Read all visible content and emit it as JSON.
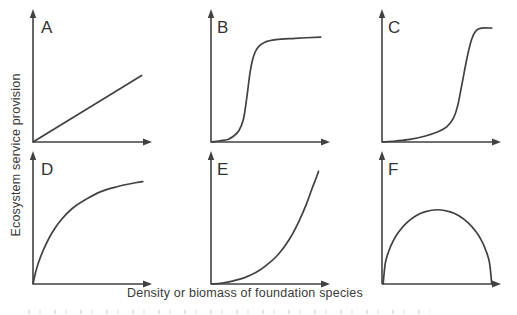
{
  "figure": {
    "y_axis_label": "Ecosystem service provision",
    "x_axis_label": "Density or biomass of foundation species",
    "line_color": "#414141",
    "text_color": "#3a3a3a",
    "axes": {
      "ticks": false,
      "arrowheads": true,
      "tick_labels": "none (conceptual diagram)"
    }
  },
  "chart_data": [
    {
      "type": "line",
      "panel": "A",
      "shape": "linear increase",
      "x_range_norm": [
        0,
        1
      ],
      "y_range_norm": [
        0,
        1
      ],
      "points": [
        [
          0,
          0
        ],
        [
          0.97,
          0.52
        ]
      ]
    },
    {
      "type": "line",
      "panel": "B",
      "shape": "sigmoidal, low threshold, early saturation",
      "points": [
        [
          0,
          0
        ],
        [
          0.08,
          0.01
        ],
        [
          0.15,
          0.02
        ],
        [
          0.2,
          0.045
        ],
        [
          0.25,
          0.09
        ],
        [
          0.29,
          0.18
        ],
        [
          0.32,
          0.35
        ],
        [
          0.35,
          0.55
        ],
        [
          0.38,
          0.67
        ],
        [
          0.42,
          0.74
        ],
        [
          0.48,
          0.78
        ],
        [
          0.58,
          0.8
        ],
        [
          0.75,
          0.81
        ],
        [
          0.98,
          0.82
        ]
      ]
    },
    {
      "type": "line",
      "panel": "C",
      "shape": "sigmoidal, high threshold, late saturation",
      "points": [
        [
          0,
          0
        ],
        [
          0.12,
          0.008
        ],
        [
          0.25,
          0.02
        ],
        [
          0.38,
          0.045
        ],
        [
          0.5,
          0.08
        ],
        [
          0.58,
          0.12
        ],
        [
          0.64,
          0.19
        ],
        [
          0.68,
          0.3
        ],
        [
          0.72,
          0.48
        ],
        [
          0.76,
          0.66
        ],
        [
          0.8,
          0.8
        ],
        [
          0.84,
          0.87
        ],
        [
          0.89,
          0.89
        ],
        [
          0.98,
          0.89
        ]
      ]
    },
    {
      "type": "line",
      "panel": "D",
      "shape": "saturating / asymptotic (decelerating increase)",
      "points": [
        [
          0,
          0
        ],
        [
          0.02,
          0.08
        ],
        [
          0.05,
          0.17
        ],
        [
          0.1,
          0.28
        ],
        [
          0.17,
          0.4
        ],
        [
          0.25,
          0.5
        ],
        [
          0.35,
          0.59
        ],
        [
          0.47,
          0.66
        ],
        [
          0.6,
          0.72
        ],
        [
          0.75,
          0.76
        ],
        [
          0.88,
          0.785
        ],
        [
          0.98,
          0.8
        ]
      ]
    },
    {
      "type": "line",
      "panel": "E",
      "shape": "exponential / accelerating increase",
      "points": [
        [
          0,
          0
        ],
        [
          0.1,
          0.008
        ],
        [
          0.2,
          0.025
        ],
        [
          0.3,
          0.05
        ],
        [
          0.4,
          0.09
        ],
        [
          0.5,
          0.15
        ],
        [
          0.6,
          0.23
        ],
        [
          0.7,
          0.35
        ],
        [
          0.78,
          0.48
        ],
        [
          0.85,
          0.62
        ],
        [
          0.9,
          0.74
        ],
        [
          0.94,
          0.83
        ],
        [
          0.96,
          0.88
        ]
      ]
    },
    {
      "type": "line",
      "panel": "F",
      "shape": "unimodal / hump-shaped (rises then returns to zero)",
      "points": [
        [
          0.01,
          0
        ],
        [
          0.03,
          0.165
        ],
        [
          0.06,
          0.256
        ],
        [
          0.1,
          0.337
        ],
        [
          0.15,
          0.408
        ],
        [
          0.22,
          0.478
        ],
        [
          0.3,
          0.531
        ],
        [
          0.38,
          0.563
        ],
        [
          0.495,
          0.58
        ],
        [
          0.61,
          0.563
        ],
        [
          0.69,
          0.531
        ],
        [
          0.77,
          0.478
        ],
        [
          0.84,
          0.408
        ],
        [
          0.89,
          0.337
        ],
        [
          0.93,
          0.256
        ],
        [
          0.96,
          0.165
        ],
        [
          0.98,
          0
        ]
      ]
    }
  ]
}
